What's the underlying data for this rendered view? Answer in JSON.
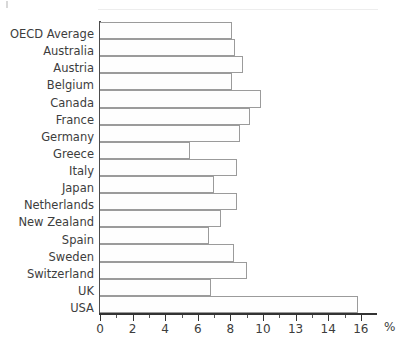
{
  "chart_data": {
    "type": "bar",
    "orientation": "horizontal",
    "title": "",
    "subtitle": "",
    "xlabel": "%",
    "ylabel": "",
    "categories": [
      "OECD Average",
      "Australia",
      "Austria",
      "Belgium",
      "Canada",
      "France",
      "Germany",
      "Greece",
      "Italy",
      "Japan",
      "Netherlands",
      "New Zealand",
      "Spain",
      "Sweden",
      "Switzerland",
      "UK",
      "USA"
    ],
    "values": [
      8.1,
      8.3,
      8.8,
      8.1,
      9.9,
      9.2,
      8.6,
      5.5,
      8.4,
      7.0,
      8.4,
      7.4,
      6.7,
      8.2,
      9.0,
      6.8,
      15.8
    ],
    "xlim": [
      0,
      17
    ],
    "x_tick_values": [
      0,
      2,
      4,
      6,
      8,
      10,
      12,
      14,
      16
    ],
    "x_tick_labels": [
      "0",
      "2",
      "4",
      "6",
      "8",
      "10",
      "13",
      "14",
      "16"
    ],
    "x_minor_tick_values": [
      1,
      3,
      5,
      7,
      9,
      11,
      13,
      15
    ],
    "grid": false,
    "legend": false,
    "legend_position": "none",
    "bar_fill_color": "#fefefe",
    "bar_border_color": "#9b9b9b",
    "axis_color": "#333333",
    "text_color": "#3d3d3d"
  },
  "axis": {
    "unit_symbol": "%"
  }
}
